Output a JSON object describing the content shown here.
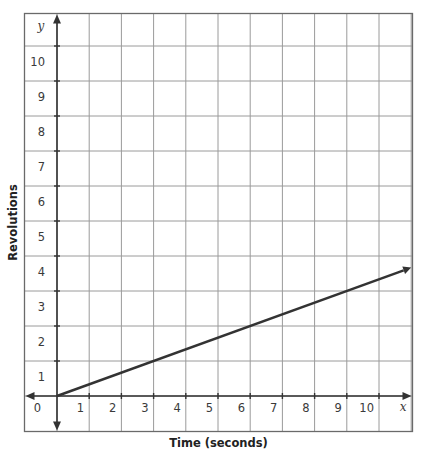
{
  "chart_data": {
    "type": "line",
    "title": "",
    "xlabel": "Time (seconds)",
    "ylabel": "Revolutions",
    "x_axis_variable": "x",
    "y_axis_variable": "y",
    "xlim": [
      -1,
      11
    ],
    "ylim": [
      -1,
      11
    ],
    "x_ticks": [
      0,
      1,
      2,
      3,
      4,
      5,
      6,
      7,
      8,
      9,
      10
    ],
    "y_ticks": [
      1,
      2,
      3,
      4,
      5,
      6,
      7,
      8,
      9,
      10
    ],
    "origin_label": "0",
    "grid": true,
    "legend": null,
    "series": [
      {
        "name": "Revolutions vs Time",
        "equation": "y = x/3",
        "color": "#333333",
        "points": [
          [
            0,
            0
          ],
          [
            3,
            1
          ],
          [
            6,
            2
          ],
          [
            9,
            3
          ],
          [
            11,
            3.67
          ]
        ],
        "arrow_end": true
      }
    ]
  },
  "colors": {
    "grid": "#9a9a9a",
    "frame": "#6a6a6a",
    "axes": "#333333",
    "line": "#333333"
  }
}
